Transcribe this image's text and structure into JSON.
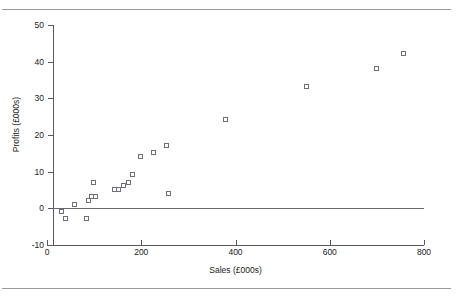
{
  "chart_data": {
    "type": "scatter",
    "title": "",
    "xlabel": "Sales (£000s)",
    "ylabel": "Profits (£000s)",
    "xlim": [
      0,
      800
    ],
    "ylim": [
      -10,
      50
    ],
    "xticks": [
      0,
      200,
      400,
      600,
      800
    ],
    "yticks": [
      -10,
      0,
      10,
      20,
      30,
      40,
      50
    ],
    "grid": false,
    "legend": null,
    "marker": "open-square",
    "marker_color": "#6e6e7a",
    "zero_line": 0,
    "series": [
      {
        "name": "Sales vs Profits",
        "points": [
          {
            "x": 32,
            "y": -1
          },
          {
            "x": 40,
            "y": -3
          },
          {
            "x": 60,
            "y": 1
          },
          {
            "x": 85,
            "y": -3
          },
          {
            "x": 90,
            "y": 2
          },
          {
            "x": 95,
            "y": 3
          },
          {
            "x": 100,
            "y": 7
          },
          {
            "x": 105,
            "y": 3
          },
          {
            "x": 145,
            "y": 5
          },
          {
            "x": 152,
            "y": 5
          },
          {
            "x": 163,
            "y": 6
          },
          {
            "x": 175,
            "y": 7
          },
          {
            "x": 183,
            "y": 9
          },
          {
            "x": 200,
            "y": 14
          },
          {
            "x": 228,
            "y": 15
          },
          {
            "x": 255,
            "y": 17
          },
          {
            "x": 258,
            "y": 4
          },
          {
            "x": 380,
            "y": 24
          },
          {
            "x": 552,
            "y": 33
          },
          {
            "x": 700,
            "y": 38
          },
          {
            "x": 758,
            "y": 42
          }
        ]
      }
    ]
  },
  "axes": {
    "x": {
      "tick_labels": [
        "0",
        "200",
        "400",
        "600",
        "800"
      ],
      "title": "Sales (£000s)"
    },
    "y": {
      "tick_labels": [
        "50",
        "40",
        "30",
        "20",
        "10",
        "0",
        "-10"
      ],
      "title": "Profits (£000s)"
    }
  },
  "colors": {
    "background": "#ffffff",
    "axis": "#5a5a5a",
    "marker": "#6e6e7a",
    "rule": "#9a9a9a",
    "text": "#1a1a1a"
  }
}
